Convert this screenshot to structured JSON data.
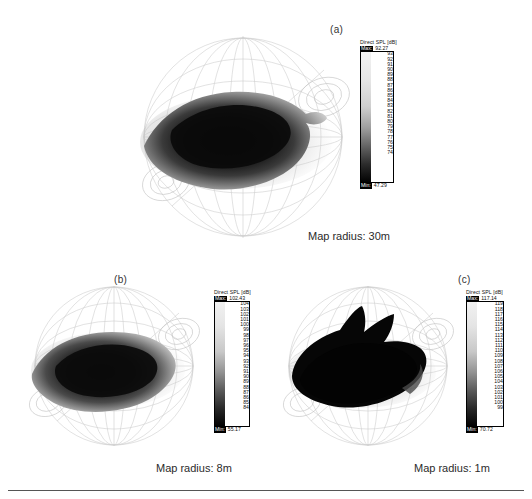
{
  "figure": {
    "background": "#ffffff",
    "ink": "#1a1a1a"
  },
  "panels": [
    {
      "id": "a",
      "label": "(a)",
      "caption": "Map radius: 30m",
      "colorbar": {
        "title": "Direct SPL [dB]",
        "max_label": "Max:",
        "max_value": "92.27",
        "min_label": "Min:",
        "min_value": "47.29",
        "ticks": [
          "93",
          "92",
          "91",
          "90",
          "89",
          "88",
          "87",
          "86",
          "85",
          "84",
          "83",
          "82",
          "81",
          "80",
          "79",
          "78",
          "77",
          "76",
          "75",
          "74"
        ],
        "ramp_top_color": "#f2f2f2",
        "ramp_bottom_color": "#000000"
      }
    },
    {
      "id": "b",
      "label": "(b)",
      "caption": "Map radius: 8m",
      "colorbar": {
        "title": "Direct SPL [dB]",
        "max_label": "Max:",
        "max_value": "102.43",
        "min_label": "Min:",
        "min_value": "55.17",
        "ticks": [
          "104",
          "103",
          "102",
          "101",
          "100",
          "99",
          "98",
          "97",
          "96",
          "95",
          "94",
          "93",
          "92",
          "91",
          "90",
          "89",
          "88",
          "87",
          "86",
          "85",
          "84"
        ],
        "ramp_top_color": "#f2f2f2",
        "ramp_bottom_color": "#000000"
      }
    },
    {
      "id": "c",
      "label": "(c)",
      "caption": "Map radius: 1m",
      "colorbar": {
        "title": "Direct SPL [dB]",
        "max_label": "Max:",
        "max_value": "117.14",
        "min_label": "Min:",
        "min_value": "70.72",
        "ticks": [
          "119",
          "118",
          "117",
          "116",
          "115",
          "114",
          "113",
          "112",
          "111",
          "110",
          "109",
          "108",
          "107",
          "106",
          "105",
          "104",
          "103",
          "102",
          "101",
          "100",
          "99"
        ],
        "ramp_top_color": "#f2f2f2",
        "ramp_bottom_color": "#000000"
      }
    }
  ]
}
